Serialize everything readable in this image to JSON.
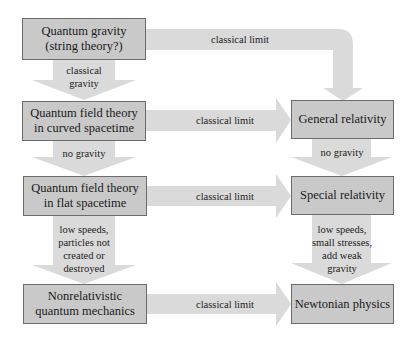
{
  "colors": {
    "box_fill": "#c9c9c9",
    "box_border": "#6b6b6b",
    "arrow_fill": "#dadada",
    "background": "#ffffff"
  },
  "nodes": {
    "quantum_gravity": "Quantum gravity (string theory?)",
    "qft_curved": "Quantum field theory in curved spacetime",
    "qft_flat": "Quantum field theory in flat spacetime",
    "nonrel_qm": "Nonrelativistic quantum mechanics",
    "general_relativity": "General relativity",
    "special_relativity": "Special relativity",
    "newtonian": "Newtonian physics"
  },
  "edges": {
    "qg_to_gr": "classical limit",
    "qg_to_qftc": "classical gravity",
    "qftc_to_gr": "classical limit",
    "qftc_to_qftf": "no gravity",
    "gr_to_sr": "no gravity",
    "qftf_to_sr": "classical limit",
    "qftf_to_nrqm": "low speeds, particles not created or destroyed",
    "sr_to_newton": "low speeds, small stresses, add weak gravity",
    "nrqm_to_newton": "classical limit"
  }
}
